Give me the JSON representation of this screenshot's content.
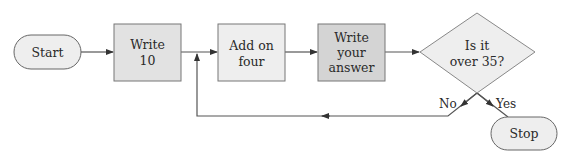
{
  "diagram": {
    "type": "flowchart",
    "nodes": {
      "start": {
        "shape": "terminator",
        "label": "Start"
      },
      "write10": {
        "shape": "process",
        "lines": [
          "Write",
          "10"
        ]
      },
      "addfour": {
        "shape": "process",
        "lines": [
          "Add on",
          "four"
        ]
      },
      "writeanswer": {
        "shape": "process",
        "lines": [
          "Write",
          "your",
          "answer"
        ]
      },
      "decision": {
        "shape": "decision",
        "lines": [
          "Is it",
          "over 35?"
        ]
      },
      "stop": {
        "shape": "terminator",
        "label": "Stop"
      }
    },
    "edges": {
      "no_label": "No",
      "yes_label": "Yes"
    },
    "colors": {
      "stroke": "#555555",
      "light_fill": "#eeeeee",
      "mid_fill": "#e2e2e2",
      "dark_fill": "#d4d4d4",
      "text": "#2a2a2a"
    }
  }
}
